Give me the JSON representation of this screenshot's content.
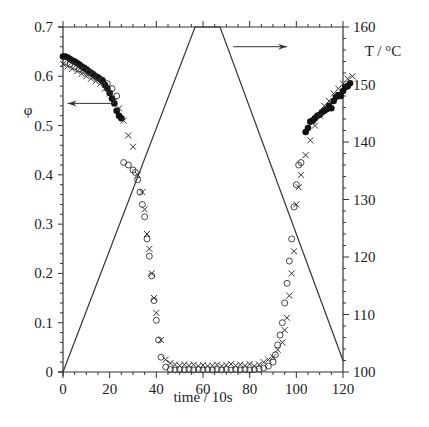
{
  "chart_data": {
    "type": "scatter",
    "title": "",
    "xlabel": "time / 10s",
    "ylabel": "φ",
    "y2label": "T / °C",
    "xlim": [
      -2,
      125
    ],
    "ylim": [
      0,
      0.7
    ],
    "y2lim": [
      100,
      160
    ],
    "grid": false,
    "legend": "none",
    "x_ticks": [
      0,
      20,
      40,
      60,
      80,
      100,
      120
    ],
    "y_ticks": [
      0,
      0.1,
      0.2,
      0.3,
      0.4,
      0.5,
      0.6,
      0.7
    ],
    "y2_ticks": [
      100,
      110,
      120,
      130,
      140,
      150,
      160
    ],
    "annotations": [
      {
        "type": "arrow",
        "direction": "left",
        "meaning": "phi data refer to left axis",
        "from": [
          22,
          0.545
        ],
        "to": [
          2,
          0.545
        ]
      },
      {
        "type": "arrow",
        "direction": "right",
        "meaning": "temperature line refers to right axis",
        "from": [
          73,
          0.66
        ],
        "to": [
          96,
          0.66
        ]
      }
    ],
    "series": [
      {
        "name": "Temperature",
        "axis": "right",
        "marker": "line",
        "x": [
          0,
          56.6,
          67.3,
          120
        ],
        "values": [
          100,
          160,
          160,
          102
        ]
      },
      {
        "name": "phi (filled circles)",
        "axis": "left",
        "marker": "filled-circle",
        "x": [
          0,
          1,
          2,
          3,
          4,
          5,
          6,
          7,
          8,
          9,
          10,
          11,
          12,
          13,
          14,
          15,
          16,
          17,
          18,
          19,
          20,
          21,
          22,
          23,
          24,
          25,
          104,
          105,
          106,
          107,
          108,
          109,
          110,
          111,
          112,
          113,
          114,
          115,
          116,
          117,
          118,
          119,
          120,
          121,
          122,
          123
        ],
        "values": [
          0.64,
          0.64,
          0.638,
          0.635,
          0.632,
          0.63,
          0.627,
          0.624,
          0.62,
          0.617,
          0.614,
          0.61,
          0.607,
          0.604,
          0.6,
          0.597,
          0.594,
          0.59,
          0.582,
          0.575,
          0.566,
          0.555,
          0.545,
          0.53,
          0.52,
          0.515,
          0.487,
          0.495,
          0.508,
          0.51,
          0.515,
          0.52,
          0.522,
          0.527,
          0.53,
          0.533,
          0.54,
          0.535,
          0.55,
          0.558,
          0.562,
          0.56,
          0.57,
          0.578,
          0.58,
          0.586
        ]
      },
      {
        "name": "phi (crosses)",
        "axis": "left",
        "marker": "cross",
        "x": [
          0,
          2,
          4,
          6,
          8,
          10,
          12,
          14,
          16,
          18,
          20,
          22,
          24,
          26,
          28,
          30,
          32,
          34,
          35,
          36,
          37,
          38,
          39,
          40,
          42,
          44,
          46,
          48,
          50,
          52,
          54,
          56,
          58,
          60,
          62,
          64,
          66,
          68,
          70,
          72,
          74,
          76,
          78,
          80,
          82,
          84,
          86,
          88,
          90,
          92,
          94,
          95,
          96,
          97,
          98,
          99,
          100,
          101,
          102,
          104,
          106,
          108,
          110,
          112,
          114,
          116,
          118,
          120,
          122,
          124
        ],
        "values": [
          0.625,
          0.62,
          0.615,
          0.61,
          0.605,
          0.6,
          0.595,
          0.59,
          0.585,
          0.575,
          0.565,
          0.55,
          0.535,
          0.51,
          0.48,
          0.457,
          0.4,
          0.365,
          0.33,
          0.28,
          0.25,
          0.2,
          0.15,
          0.12,
          0.065,
          0.025,
          0.018,
          0.015,
          0.013,
          0.015,
          0.013,
          0.015,
          0.012,
          0.014,
          0.012,
          0.013,
          0.015,
          0.012,
          0.014,
          0.016,
          0.013,
          0.015,
          0.013,
          0.016,
          0.012,
          0.015,
          0.02,
          0.025,
          0.03,
          0.045,
          0.06,
          0.085,
          0.11,
          0.155,
          0.2,
          0.245,
          0.34,
          0.375,
          0.4,
          0.44,
          0.47,
          0.5,
          0.52,
          0.54,
          0.55,
          0.565,
          0.575,
          0.585,
          0.595,
          0.6
        ]
      },
      {
        "name": "phi (open circles)",
        "axis": "left",
        "marker": "open-circle",
        "x": [
          1,
          3,
          5,
          7,
          9,
          11,
          13,
          15,
          17,
          19,
          21,
          23,
          26,
          28,
          30,
          31,
          32,
          33,
          34,
          35,
          36,
          37,
          38,
          39,
          40,
          41,
          42,
          44,
          46,
          48,
          50,
          52,
          54,
          56,
          58,
          60,
          62,
          64,
          66,
          68,
          70,
          72,
          74,
          76,
          78,
          80,
          82,
          84,
          86,
          88,
          90,
          91,
          92,
          93,
          94,
          95,
          96,
          97,
          98,
          99,
          100,
          101,
          102
        ],
        "values": [
          0.63,
          0.625,
          0.62,
          0.615,
          0.612,
          0.607,
          0.603,
          0.598,
          0.592,
          0.585,
          0.575,
          0.56,
          0.425,
          0.42,
          0.41,
          0.405,
          0.39,
          0.365,
          0.34,
          0.315,
          0.27,
          0.235,
          0.195,
          0.145,
          0.105,
          0.065,
          0.03,
          0.01,
          0.005,
          0.004,
          0.005,
          0.004,
          0.005,
          0.004,
          0.005,
          0.004,
          0.005,
          0.004,
          0.005,
          0.004,
          0.005,
          0.004,
          0.005,
          0.004,
          0.005,
          0.004,
          0.005,
          0.006,
          0.008,
          0.012,
          0.02,
          0.035,
          0.055,
          0.075,
          0.1,
          0.14,
          0.18,
          0.225,
          0.27,
          0.335,
          0.38,
          0.42,
          0.425
        ]
      }
    ]
  }
}
